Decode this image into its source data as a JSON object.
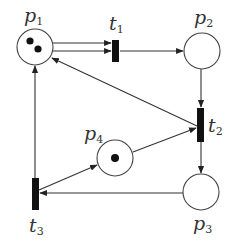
{
  "diagram": {
    "type": "petri-net",
    "colors": {
      "stroke": "#333333",
      "transition": "#111111",
      "background": "#ffffff"
    },
    "places": [
      {
        "id": "p1",
        "label": "p",
        "sub": "1",
        "cx": 35,
        "cy": 47,
        "r": 18,
        "tokens": 2,
        "label_x": 24,
        "label_y": 22
      },
      {
        "id": "p2",
        "label": "p",
        "sub": "2",
        "cx": 202,
        "cy": 51,
        "r": 18,
        "tokens": 0,
        "label_x": 194,
        "label_y": 24
      },
      {
        "id": "p3",
        "label": "p",
        "sub": "3",
        "cx": 201,
        "cy": 192,
        "r": 18,
        "tokens": 0,
        "label_x": 193,
        "label_y": 230
      },
      {
        "id": "p4",
        "label": "p",
        "sub": "4",
        "cx": 115,
        "cy": 158,
        "r": 18,
        "tokens": 1,
        "label_x": 84,
        "label_y": 140
      }
    ],
    "transitions": [
      {
        "id": "t1",
        "label": "t",
        "sub": "1",
        "x": 112,
        "y": 40,
        "w": 7,
        "h": 22,
        "label_x": 111,
        "label_y": 30
      },
      {
        "id": "t2",
        "label": "t",
        "sub": "2",
        "x": 197,
        "y": 108,
        "w": 7,
        "h": 34,
        "label_x": 208,
        "label_y": 132
      },
      {
        "id": "t3",
        "label": "t",
        "sub": "3",
        "x": 32,
        "y": 178,
        "w": 7,
        "h": 32,
        "label_x": 30,
        "label_y": 232
      }
    ],
    "arcs": [
      {
        "from": "p1",
        "to": "t1",
        "note": "double arc (weight 2)"
      },
      {
        "from": "t1",
        "to": "p2"
      },
      {
        "from": "p2",
        "to": "t2"
      },
      {
        "from": "t2",
        "to": "p1"
      },
      {
        "from": "t2",
        "to": "p3"
      },
      {
        "from": "p4",
        "to": "t2"
      },
      {
        "from": "p3",
        "to": "t3"
      },
      {
        "from": "t3",
        "to": "p1"
      },
      {
        "from": "t3",
        "to": "p4"
      }
    ]
  }
}
